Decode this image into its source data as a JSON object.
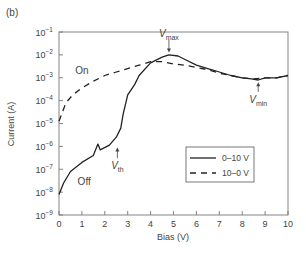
{
  "panel_label": "(b)",
  "chart_data": {
    "type": "line",
    "title": "",
    "xlabel": "Bias (V)",
    "ylabel": "Current (A)",
    "xlim": [
      0,
      10
    ],
    "ylim_log10": [
      -9,
      -1
    ],
    "yscale": "log",
    "grid": false,
    "legend_position": "lower right (inside)",
    "x_ticks": [
      "0",
      "1",
      "2",
      "3",
      "4",
      "5",
      "6",
      "7",
      "8",
      "9",
      "10"
    ],
    "y_ticks": [
      {
        "base": "10",
        "exp": "−1",
        "log": -1
      },
      {
        "base": "10",
        "exp": "−2",
        "log": -2
      },
      {
        "base": "10",
        "exp": "−3",
        "log": -3
      },
      {
        "base": "10",
        "exp": "−4",
        "log": -4
      },
      {
        "base": "10",
        "exp": "−5",
        "log": -5
      },
      {
        "base": "10",
        "exp": "−6",
        "log": -6
      },
      {
        "base": "10",
        "exp": "−7",
        "log": -7
      },
      {
        "base": "10",
        "exp": "−8",
        "log": -8
      },
      {
        "base": "10",
        "exp": "−9",
        "log": -9
      }
    ],
    "series": [
      {
        "name": "0–10 V",
        "style": "solid",
        "color": "#222222",
        "x": [
          0,
          0.2,
          0.5,
          1.0,
          1.5,
          1.7,
          1.8,
          2.2,
          2.5,
          2.7,
          2.8,
          3.0,
          3.3,
          3.5,
          4.0,
          4.5,
          4.8,
          5.2,
          5.5,
          6.0,
          6.5,
          7.0,
          7.5,
          8.0,
          8.4,
          8.7,
          9.0,
          9.5,
          10.0
        ],
        "log10_current": [
          -8.1,
          -7.6,
          -7.1,
          -6.7,
          -6.4,
          -5.9,
          -6.15,
          -5.95,
          -5.6,
          -5.2,
          -4.6,
          -3.75,
          -3.3,
          -2.9,
          -2.35,
          -2.1,
          -2.0,
          -2.05,
          -2.2,
          -2.45,
          -2.6,
          -2.75,
          -2.9,
          -3.0,
          -3.05,
          -3.1,
          -3.0,
          -3.0,
          -2.9
        ]
      },
      {
        "name": "10–0 V",
        "style": "dashed",
        "color": "#222222",
        "x": [
          0,
          0.3,
          0.6,
          1.0,
          1.5,
          2.0,
          2.5,
          3.0,
          3.5,
          4.0,
          4.5,
          5.0,
          5.5,
          6.0,
          6.5,
          7.0,
          7.5,
          8.0,
          8.5,
          9.0,
          9.5,
          10.0
        ],
        "log10_current": [
          -4.9,
          -4.1,
          -3.75,
          -3.45,
          -3.15,
          -2.9,
          -2.75,
          -2.6,
          -2.45,
          -2.3,
          -2.3,
          -2.4,
          -2.45,
          -2.55,
          -2.65,
          -2.8,
          -2.9,
          -3.0,
          -3.05,
          -3.0,
          -3.0,
          -2.9
        ]
      }
    ],
    "annotations": [
      {
        "text": "On",
        "x": 1.0,
        "log10": -2.85,
        "arrow": false
      },
      {
        "text": "Off",
        "x": 1.1,
        "log10": -7.7,
        "arrow": false
      },
      {
        "text": "V",
        "sub": "max",
        "x": 4.8,
        "log10": -1.2,
        "arrow_to_log10": -1.9
      },
      {
        "text": "V",
        "sub": "th",
        "x": 2.55,
        "log10": -7.0,
        "arrow_to_log10": -6.05
      },
      {
        "text": "V",
        "sub": "min",
        "x": 8.7,
        "log10": -4.1,
        "arrow_to_log10": -3.2
      }
    ]
  },
  "legend": {
    "items": [
      {
        "label": "0–10 V",
        "style": "solid"
      },
      {
        "label": "10–0 V",
        "style": "dashed"
      }
    ]
  }
}
